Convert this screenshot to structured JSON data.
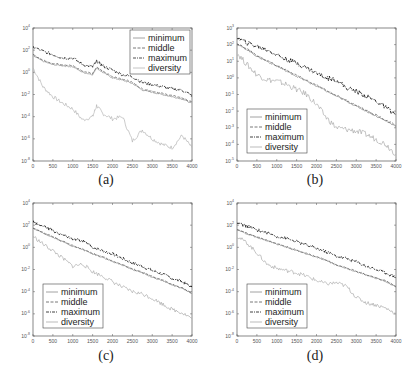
{
  "figure": {
    "top_caption_fragment": "",
    "legend_labels": [
      "minimum",
      "middle",
      "maximum",
      "diversity"
    ]
  },
  "chart_data": [
    {
      "id": "a",
      "type": "line",
      "label": "(a)",
      "title": "",
      "xlabel": "",
      "ylabel": "",
      "x_ticks": [
        0,
        500,
        1000,
        1500,
        2000,
        2500,
        3000,
        3500,
        4000
      ],
      "xlim": [
        0,
        4000
      ],
      "y_scale": "log",
      "y_ticks_exp": [
        4,
        2,
        0,
        -2,
        -4,
        -6,
        -8
      ],
      "ylim_exp": [
        -8,
        4
      ],
      "legend": {
        "position": "upper right",
        "entries": [
          "minimum",
          "middle",
          "maximum",
          "diversity"
        ]
      },
      "grid": false,
      "x": [
        0,
        250,
        500,
        750,
        1000,
        1250,
        1500,
        1600,
        1750,
        2000,
        2250,
        2500,
        2750,
        3000,
        3250,
        3500,
        3750,
        4000
      ],
      "series": [
        {
          "name": "minimum",
          "color": "#8a8a8a",
          "style": "solid",
          "log10": [
            1.5,
            1.0,
            0.7,
            0.6,
            0.5,
            0.0,
            -0.2,
            0.4,
            0.0,
            -0.5,
            -0.7,
            -1.0,
            -1.6,
            -1.8,
            -2.0,
            -2.2,
            -2.4,
            -2.8
          ]
        },
        {
          "name": "middle",
          "color": "#555555",
          "style": "dashed",
          "log10": [
            1.6,
            1.1,
            0.8,
            0.7,
            0.6,
            0.1,
            -0.1,
            0.5,
            0.1,
            -0.4,
            -0.6,
            -0.9,
            -1.5,
            -1.7,
            -1.9,
            -2.1,
            -2.3,
            -2.7
          ]
        },
        {
          "name": "maximum",
          "color": "#222222",
          "style": "dashdot",
          "log10": [
            2.3,
            1.9,
            1.6,
            1.3,
            1.3,
            0.7,
            0.5,
            1.0,
            0.6,
            0.2,
            -0.2,
            -0.4,
            -0.9,
            -1.1,
            -1.3,
            -1.5,
            -1.6,
            -2.1
          ]
        },
        {
          "name": "diversity",
          "color": "#b5b5b5",
          "style": "solid",
          "log10": [
            0.4,
            -1.3,
            -2.2,
            -2.8,
            -3.3,
            -4.3,
            -4.0,
            -3.0,
            -3.7,
            -4.2,
            -4.0,
            -6.2,
            -5.2,
            -6.0,
            -6.5,
            -6.8,
            -5.7,
            -6.8
          ]
        }
      ]
    },
    {
      "id": "b",
      "type": "line",
      "label": "(b)",
      "title": "",
      "xlabel": "",
      "ylabel": "",
      "x_ticks": [
        0,
        500,
        1000,
        1500,
        2000,
        2500,
        3000,
        3500,
        4000
      ],
      "xlim": [
        0,
        4000
      ],
      "y_scale": "log",
      "y_ticks_exp": [
        3,
        2,
        1,
        0,
        -1,
        -2,
        -3,
        -4,
        -5
      ],
      "ylim_exp": [
        -5,
        3
      ],
      "legend": {
        "position": "lower left",
        "entries": [
          "minimum",
          "middle",
          "maximum",
          "diversity"
        ]
      },
      "grid": false,
      "x": [
        0,
        250,
        500,
        750,
        1000,
        1250,
        1500,
        1750,
        2000,
        2250,
        2500,
        2750,
        3000,
        3250,
        3500,
        3750,
        4000
      ],
      "series": [
        {
          "name": "minimum",
          "color": "#8a8a8a",
          "style": "solid",
          "log10": [
            2.0,
            1.7,
            1.3,
            1.0,
            0.7,
            0.4,
            0.1,
            -0.2,
            -0.5,
            -0.8,
            -1.1,
            -1.4,
            -1.7,
            -2.0,
            -2.3,
            -2.6,
            -2.9
          ]
        },
        {
          "name": "middle",
          "color": "#555555",
          "style": "dashed",
          "log10": [
            2.05,
            1.75,
            1.35,
            1.05,
            0.75,
            0.45,
            0.15,
            -0.15,
            -0.45,
            -0.75,
            -1.05,
            -1.35,
            -1.65,
            -1.95,
            -2.25,
            -2.55,
            -2.85
          ]
        },
        {
          "name": "maximum",
          "color": "#111111",
          "style": "dashdot",
          "log10": [
            2.4,
            2.1,
            1.9,
            1.7,
            1.4,
            1.1,
            0.9,
            0.6,
            0.3,
            0.0,
            -0.1,
            -0.6,
            -0.8,
            -1.1,
            -1.4,
            -1.8,
            -2.2
          ]
        },
        {
          "name": "diversity",
          "color": "#aaaaaa",
          "style": "solid",
          "log10": [
            1.5,
            0.8,
            0.2,
            -0.1,
            -0.2,
            -0.4,
            -0.7,
            -1.0,
            -1.6,
            -2.4,
            -3.0,
            -3.1,
            -3.2,
            -3.4,
            -3.7,
            -4.0,
            -4.6
          ]
        }
      ]
    },
    {
      "id": "c",
      "type": "line",
      "label": "(c)",
      "title": "",
      "xlabel": "",
      "ylabel": "",
      "x_ticks": [
        0,
        500,
        1000,
        1500,
        2000,
        2500,
        3000,
        3500,
        4000
      ],
      "xlim": [
        0,
        4000
      ],
      "y_scale": "log",
      "y_ticks_exp": [
        4,
        2,
        0,
        -2,
        -4,
        -6,
        -8
      ],
      "ylim_exp": [
        -8,
        4
      ],
      "legend": {
        "position": "lower left",
        "entries": [
          "minimum",
          "middle",
          "maximum",
          "diversity"
        ]
      },
      "grid": false,
      "x": [
        0,
        250,
        500,
        750,
        1000,
        1250,
        1500,
        1750,
        2000,
        2250,
        2500,
        2750,
        3000,
        3250,
        3500,
        3750,
        4000
      ],
      "series": [
        {
          "name": "minimum",
          "color": "#8a8a8a",
          "style": "solid",
          "log10": [
            1.7,
            1.3,
            0.9,
            0.5,
            0.1,
            -0.2,
            -0.6,
            -0.9,
            -1.3,
            -1.6,
            -2.0,
            -2.3,
            -2.7,
            -3.0,
            -3.4,
            -3.7,
            -4.2
          ]
        },
        {
          "name": "middle",
          "color": "#555555",
          "style": "dashed",
          "log10": [
            1.75,
            1.35,
            0.95,
            0.55,
            0.15,
            -0.15,
            -0.55,
            -0.85,
            -1.25,
            -1.55,
            -1.95,
            -2.25,
            -2.65,
            -2.95,
            -3.35,
            -3.65,
            -4.15
          ]
        },
        {
          "name": "maximum",
          "color": "#111111",
          "style": "dashdot",
          "log10": [
            2.3,
            1.9,
            1.5,
            1.1,
            0.7,
            0.6,
            0.0,
            -0.3,
            -0.6,
            -1.0,
            -1.4,
            -1.7,
            -2.1,
            -2.4,
            -2.8,
            -3.1,
            -3.6
          ]
        },
        {
          "name": "diversity",
          "color": "#aaaaaa",
          "style": "solid",
          "log10": [
            1.0,
            0.3,
            -0.3,
            -1.0,
            -1.7,
            -1.5,
            -2.2,
            -2.6,
            -3.1,
            -3.6,
            -4.0,
            -4.2,
            -4.6,
            -5.1,
            -5.6,
            -5.9,
            -6.4
          ]
        }
      ]
    },
    {
      "id": "d",
      "type": "line",
      "label": "(d)",
      "title": "",
      "xlabel": "",
      "ylabel": "",
      "x_ticks": [
        0,
        500,
        1000,
        1500,
        2000,
        2500,
        3000,
        3500,
        4000
      ],
      "xlim": [
        0,
        4000
      ],
      "y_scale": "log",
      "y_ticks_exp": [
        4,
        2,
        0,
        -2,
        -4,
        -6,
        -8
      ],
      "ylim_exp": [
        -8,
        4
      ],
      "legend": {
        "position": "lower left",
        "entries": [
          "minimum",
          "middle",
          "maximum",
          "diversity"
        ]
      },
      "grid": false,
      "x": [
        0,
        250,
        500,
        750,
        1000,
        1250,
        1500,
        1750,
        2000,
        2250,
        2500,
        2750,
        3000,
        3250,
        3500,
        3750,
        4000
      ],
      "series": [
        {
          "name": "minimum",
          "color": "#8a8a8a",
          "style": "solid",
          "log10": [
            1.6,
            1.2,
            0.9,
            0.6,
            0.3,
            0.0,
            -0.3,
            -0.6,
            -0.9,
            -1.2,
            -1.6,
            -1.9,
            -2.2,
            -2.5,
            -2.8,
            -3.1,
            -3.6
          ]
        },
        {
          "name": "middle",
          "color": "#555555",
          "style": "dashed",
          "log10": [
            1.65,
            1.25,
            0.95,
            0.65,
            0.35,
            0.05,
            -0.25,
            -0.55,
            -0.85,
            -1.15,
            -1.55,
            -1.85,
            -2.15,
            -2.45,
            -2.75,
            -3.05,
            -3.55
          ]
        },
        {
          "name": "maximum",
          "color": "#111111",
          "style": "dashdot",
          "log10": [
            2.2,
            1.9,
            1.6,
            1.3,
            1.0,
            0.8,
            0.5,
            0.2,
            -0.1,
            -0.4,
            -0.8,
            -1.0,
            -1.3,
            -1.7,
            -2.0,
            -2.3,
            -2.7
          ]
        },
        {
          "name": "diversity",
          "color": "#aaaaaa",
          "style": "solid",
          "log10": [
            1.0,
            0.4,
            -0.5,
            -1.5,
            -1.9,
            -2.1,
            -2.3,
            -2.6,
            -3.0,
            -3.3,
            -3.2,
            -3.5,
            -4.5,
            -5.0,
            -5.2,
            -5.5,
            -6.0
          ]
        }
      ]
    }
  ]
}
